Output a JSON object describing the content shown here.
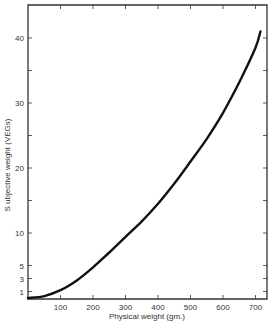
{
  "chart_data": {
    "type": "line",
    "title": "",
    "xlabel": "Physical weight (gm.)",
    "ylabel": "S ubjective weight (VEGs)",
    "xlim": [
      0,
      720
    ],
    "ylim": [
      0,
      45
    ],
    "x_ticks": [
      100,
      200,
      300,
      400,
      500,
      600,
      700
    ],
    "y_ticks": [
      1,
      3,
      5,
      10,
      20,
      30,
      40
    ],
    "y_minor_ticks": [
      15,
      25,
      35
    ],
    "grid": false,
    "legend": null,
    "series": [
      {
        "name": "Subjective weight",
        "x": [
          0,
          50,
          100,
          150,
          200,
          250,
          300,
          350,
          400,
          450,
          500,
          550,
          600,
          650,
          700,
          715
        ],
        "y": [
          0,
          0.3,
          1.2,
          2.7,
          4.7,
          7.0,
          9.4,
          11.8,
          14.5,
          17.6,
          21.0,
          24.5,
          28.5,
          33.2,
          38.5,
          41.0
        ]
      }
    ]
  }
}
